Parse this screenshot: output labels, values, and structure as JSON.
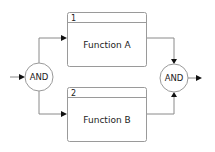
{
  "diagram": {
    "type": "process-flow",
    "functions": [
      {
        "number": "1",
        "label": "Function A"
      },
      {
        "number": "2",
        "label": "Function B"
      }
    ],
    "gates": [
      {
        "id": "split",
        "label": "AND"
      },
      {
        "id": "join",
        "label": "AND"
      }
    ],
    "connections": [
      {
        "from": "input",
        "to": "split"
      },
      {
        "from": "split",
        "to": "function-1"
      },
      {
        "from": "split",
        "to": "function-2"
      },
      {
        "from": "function-1",
        "to": "join"
      },
      {
        "from": "function-2",
        "to": "join"
      },
      {
        "from": "join",
        "to": "output"
      }
    ],
    "colors": {
      "stroke": "#9a9a9a",
      "arrow": "#111111",
      "text": "#222222",
      "background": "#ffffff"
    }
  }
}
